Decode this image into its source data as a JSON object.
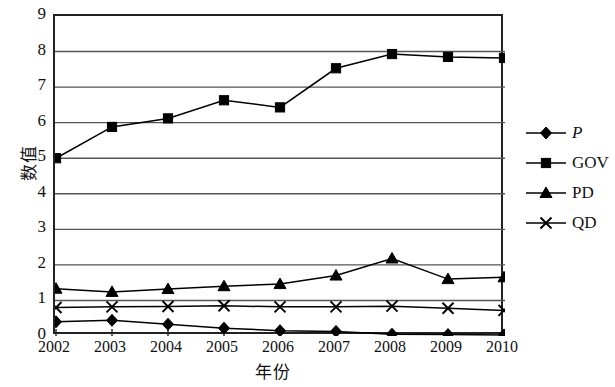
{
  "chart_data": {
    "type": "line",
    "title": "",
    "xlabel": "年份",
    "ylabel": "数值",
    "categories": [
      "2002",
      "2003",
      "2004",
      "2005",
      "2006",
      "2007",
      "2008",
      "2009",
      "2010"
    ],
    "x": [
      2002,
      2003,
      2004,
      2005,
      2006,
      2007,
      2008,
      2009,
      2010
    ],
    "xlim": [
      2002,
      2010
    ],
    "ylim": [
      0,
      9
    ],
    "yticks": [
      0,
      1,
      2,
      3,
      4,
      5,
      6,
      7,
      8,
      9
    ],
    "grid": "horizontal",
    "legend_position": "right",
    "series": [
      {
        "name": "P",
        "marker": "diamond",
        "color": "#000000",
        "values": [
          0.4,
          0.44,
          0.33,
          0.22,
          0.15,
          0.13,
          0.05,
          0.04,
          0.03
        ]
      },
      {
        "name": "GOV",
        "marker": "square",
        "color": "#000000",
        "values": [
          5.0,
          5.88,
          6.12,
          6.63,
          6.43,
          7.53,
          7.93,
          7.85,
          7.82
        ]
      },
      {
        "name": "PD",
        "marker": "triangle",
        "color": "#000000",
        "values": [
          1.33,
          1.24,
          1.32,
          1.4,
          1.46,
          1.7,
          2.18,
          1.6,
          1.65
        ]
      },
      {
        "name": "QD",
        "marker": "cross",
        "color": "#000000",
        "values": [
          0.8,
          0.82,
          0.83,
          0.85,
          0.82,
          0.82,
          0.84,
          0.78,
          0.72
        ]
      }
    ]
  },
  "legend": {
    "items": [
      {
        "label": "P",
        "marker": "diamond",
        "italic": true
      },
      {
        "label": "GOV",
        "marker": "square",
        "italic": false
      },
      {
        "label": "PD",
        "marker": "triangle",
        "italic": false
      },
      {
        "label": "QD",
        "marker": "cross",
        "italic": false
      }
    ]
  },
  "axes": {
    "y_label": "数值",
    "x_label": "年份",
    "y_tick_labels": [
      "9",
      "8",
      "7",
      "6",
      "5",
      "4",
      "3",
      "2",
      "1",
      "0"
    ],
    "x_tick_labels": [
      "2002",
      "2003",
      "2004",
      "2005",
      "2006",
      "2007",
      "2008",
      "2009",
      "2010"
    ]
  },
  "style": {
    "axis_color": "#222222",
    "grid_color": "#555555",
    "series_color": "#000000",
    "background": "#ffffff"
  }
}
